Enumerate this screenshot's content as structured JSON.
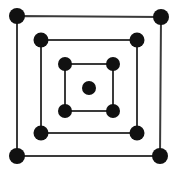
{
  "diagram": {
    "colors": {
      "background": "#ffffff",
      "line": "#3a3a3a",
      "dot": "#111111"
    },
    "squares": [
      {
        "name": "outer",
        "corners": [
          [
            17,
            16
          ],
          [
            161,
            17
          ],
          [
            160,
            156
          ],
          [
            17,
            156
          ]
        ],
        "dot_radius": 8
      },
      {
        "name": "middle",
        "corners": [
          [
            41,
            40
          ],
          [
            137,
            40
          ],
          [
            137,
            133
          ],
          [
            41,
            133
          ]
        ],
        "dot_radius": 7.5
      },
      {
        "name": "inner",
        "corners": [
          [
            65,
            64
          ],
          [
            113,
            64
          ],
          [
            113,
            111
          ],
          [
            65,
            111
          ]
        ],
        "dot_radius": 7
      }
    ],
    "center_dot": {
      "cx": 89,
      "cy": 88,
      "r": 7
    },
    "dot_count": 13
  }
}
